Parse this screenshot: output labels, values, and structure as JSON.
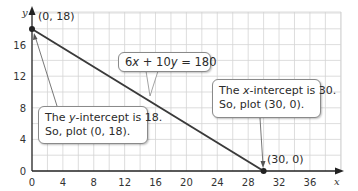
{
  "chart_data": {
    "type": "line",
    "title": "",
    "xlabel": "x",
    "ylabel": "y",
    "xlim": [
      0,
      40
    ],
    "ylim": [
      0,
      20
    ],
    "x_ticks": [
      0,
      4,
      8,
      12,
      16,
      20,
      24,
      28,
      32,
      36
    ],
    "y_ticks": [
      0,
      4,
      8,
      12,
      16
    ],
    "grid": true,
    "grid_step": 2,
    "series": [
      {
        "name": "6x + 10y = 180",
        "x": [
          0,
          30
        ],
        "y": [
          18,
          0
        ]
      }
    ],
    "points": [
      {
        "label": "(0, 18)",
        "x": 0,
        "y": 18
      },
      {
        "label": "(30, 0)",
        "x": 30,
        "y": 0
      }
    ],
    "annotations": [
      {
        "id": "equation",
        "text": "6x + 10y = 180"
      },
      {
        "id": "y_intercept",
        "line1": "The y-intercept is 18.",
        "line2": "So, plot (0, 18)."
      },
      {
        "id": "x_intercept",
        "line1": "The x-intercept is 30.",
        "line2": "So, plot (30, 0)."
      }
    ]
  },
  "labels": {
    "equation": {
      "a": "6",
      "x": "x",
      "b": " + 10",
      "y": "y",
      "c": " = 180"
    },
    "y_callout": {
      "pre": "The ",
      "var": "y",
      "post": "-intercept is 18.",
      "line2": "So, plot (0, 18)."
    },
    "x_callout": {
      "pre": "The ",
      "var": "x",
      "post": "-intercept is 30.",
      "line2": "So, plot (30, 0)."
    },
    "point_a": "(0, 18)",
    "point_b": "(30, 0)",
    "axis_x": "x",
    "axis_y": "y",
    "ticks_x": [
      "0",
      "4",
      "8",
      "12",
      "16",
      "20",
      "24",
      "28",
      "32",
      "36"
    ],
    "ticks_y": [
      "0",
      "4",
      "8",
      "12",
      "16"
    ]
  },
  "colors": {
    "line": "#3a3a3a",
    "grid": "#d4d4d4",
    "axis": "#222222"
  }
}
